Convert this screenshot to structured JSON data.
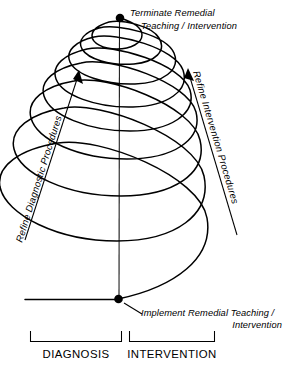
{
  "figure": {
    "title_top": {
      "line1": "Terminate Remedial",
      "line2": "Teaching / Intervention"
    },
    "label_bottom": {
      "line1": "Implement Remedial Teaching /",
      "line2": "Intervention"
    },
    "label_left": "Refine Diagnostic Procedures",
    "label_right": "Refine Intervention Procedures",
    "axis_captions": {
      "left": "DIAGNOSIS",
      "right": "INTERVENTION"
    },
    "colors": {
      "ink": "#000000",
      "background": "#ffffff",
      "axis": "#1a1a1a"
    },
    "spiral": {
      "turns": 7,
      "top_point": "Terminate Remedial Teaching / Intervention",
      "bottom_point": "Implement Remedial Teaching / Intervention"
    }
  }
}
